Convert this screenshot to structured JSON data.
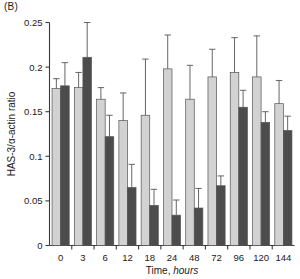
{
  "panel": {
    "label": "(B)"
  },
  "colors": {
    "light_bar": "#d2d2d2",
    "dark_bar": "#4c4c4c",
    "axis": "#3a3a3a",
    "error": "#555555",
    "background": "#ffffff"
  },
  "chart_data": {
    "type": "bar",
    "title": "",
    "xlabel": "Time, hours",
    "xlabel_plain": "Time,",
    "xlabel_italic": "hours",
    "ylabel": "HAS-3/α-actin ratio",
    "ylim": [
      0,
      0.25
    ],
    "yticks": [
      0,
      0.05,
      0.1,
      0.15,
      0.2,
      0.25
    ],
    "ytick_labels": [
      "0",
      "0.05",
      "0.1",
      "0.15",
      "0.2",
      "0.25"
    ],
    "grid": false,
    "legend": "none",
    "categories": [
      "0",
      "3",
      "6",
      "12",
      "18",
      "24",
      "48",
      "72",
      "96",
      "120",
      "144"
    ],
    "series": [
      {
        "name": "light",
        "color": "#d2d2d2",
        "values": [
          0.176,
          0.177,
          0.164,
          0.14,
          0.146,
          0.198,
          0.164,
          0.189,
          0.194,
          0.189,
          0.159
        ],
        "errors": [
          0.011,
          0.017,
          0.013,
          0.031,
          0.063,
          0.038,
          0.038,
          0.031,
          0.039,
          0.046,
          0.026
        ]
      },
      {
        "name": "dark",
        "color": "#4c4c4c",
        "values": [
          0.179,
          0.211,
          0.122,
          0.065,
          0.045,
          0.034,
          0.042,
          0.067,
          0.155,
          0.138,
          0.129
        ],
        "errors": [
          0.026,
          0.039,
          0.024,
          0.026,
          0.018,
          0.017,
          0.022,
          0.011,
          0.019,
          0.012,
          0.016
        ]
      }
    ]
  }
}
